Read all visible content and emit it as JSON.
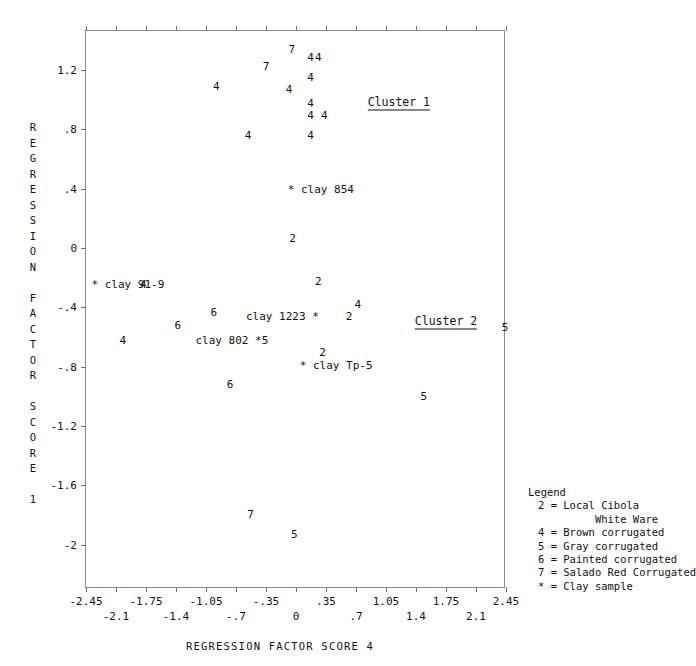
{
  "chart_data": {
    "type": "scatter",
    "title": "",
    "xlabel": "REGRESSION FACTOR SCORE 4",
    "ylabel": "REGRESSION FACTOR SCORE 1",
    "xlim": [
      -2.45,
      2.45
    ],
    "ylim": [
      -2.2,
      1.4
    ],
    "grid": false,
    "legend_position": "outside-right-bottom",
    "marker_encoding": "numeric glyph = ware type, asterisk = clay sample",
    "xticks_row1": [
      "-2.45",
      "-1.75",
      "-1.05",
      "-.35",
      ".35",
      "1.05",
      "1.75",
      "2.45"
    ],
    "xticks_row1_values": [
      -2.45,
      -1.75,
      -1.05,
      -0.35,
      0.35,
      1.05,
      1.75,
      2.45
    ],
    "xticks_row2": [
      "-2.1",
      "-1.4",
      "-.7",
      "0",
      ".7",
      "1.4",
      "2.1"
    ],
    "xticks_row2_values": [
      -2.1,
      -1.4,
      -0.7,
      0,
      0.7,
      1.4,
      2.1
    ],
    "yticks": [
      "1.2",
      ".8",
      ".4",
      "0",
      "-.4",
      "-.8",
      "-1.2",
      "-1.6",
      "-2"
    ],
    "ytick_values": [
      1.2,
      0.8,
      0.4,
      0,
      -0.4,
      -0.8,
      -1.2,
      -1.6,
      -2.0
    ],
    "points": [
      {
        "label": "7",
        "x": -0.05,
        "y": 1.34
      },
      {
        "label": "4",
        "x": 0.17,
        "y": 1.29
      },
      {
        "label": "4",
        "x": 0.26,
        "y": 1.29
      },
      {
        "label": "7",
        "x": -0.35,
        "y": 1.23
      },
      {
        "label": "4",
        "x": 0.17,
        "y": 1.15
      },
      {
        "label": "4",
        "x": -0.93,
        "y": 1.09
      },
      {
        "label": "4",
        "x": -0.08,
        "y": 1.07
      },
      {
        "label": "4",
        "x": 0.17,
        "y": 0.98
      },
      {
        "label": "4",
        "x": 0.17,
        "y": 0.9
      },
      {
        "label": "4",
        "x": 0.33,
        "y": 0.9
      },
      {
        "label": "4",
        "x": -0.56,
        "y": 0.76
      },
      {
        "label": "4",
        "x": 0.17,
        "y": 0.76
      },
      {
        "label": "2",
        "x": -0.04,
        "y": 0.07
      },
      {
        "label": "4",
        "x": -1.78,
        "y": -0.24
      },
      {
        "label": "2",
        "x": 0.26,
        "y": -0.22
      },
      {
        "label": "4",
        "x": 0.72,
        "y": -0.38
      },
      {
        "label": "2",
        "x": 0.62,
        "y": -0.46
      },
      {
        "label": "6",
        "x": -0.96,
        "y": -0.43
      },
      {
        "label": "6",
        "x": -1.38,
        "y": -0.52
      },
      {
        "label": "4",
        "x": -2.02,
        "y": -0.62
      },
      {
        "label": "5",
        "x": 2.44,
        "y": -0.53
      },
      {
        "label": "2",
        "x": 0.31,
        "y": -0.7
      },
      {
        "label": "6",
        "x": -0.77,
        "y": -0.92
      },
      {
        "label": "5",
        "x": 1.49,
        "y": -1.0
      },
      {
        "label": "7",
        "x": -0.53,
        "y": -1.79
      },
      {
        "label": "5",
        "x": -0.02,
        "y": -1.93
      }
    ],
    "clay_samples": [
      {
        "label": "clay 854",
        "x": -0.05,
        "y": 0.4,
        "text_side": "right"
      },
      {
        "label": "clay 91-9",
        "x": -2.34,
        "y": -0.24,
        "text_side": "right"
      },
      {
        "label": "clay 1223",
        "x": 0.22,
        "y": -0.46,
        "text_side": "left"
      },
      {
        "label": "clay 802",
        "x": -0.37,
        "y": -0.62,
        "text_side": "left"
      },
      {
        "label": "clay Tp-5",
        "x": 0.09,
        "y": -0.79,
        "text_side": "right"
      }
    ],
    "cluster_annotations": [
      {
        "label": "Cluster 1",
        "x": 1.2,
        "y": 0.98
      },
      {
        "label": "Cluster 2",
        "x": 1.75,
        "y": -0.5
      }
    ],
    "legend": {
      "title": "Legend",
      "entries": [
        {
          "symbol": "2",
          "description": "Local Cibola"
        },
        {
          "symbol": "",
          "description": "White Ware",
          "continuation": true
        },
        {
          "symbol": "4",
          "description": "Brown corrugated"
        },
        {
          "symbol": "5",
          "description": "Gray corrugated"
        },
        {
          "symbol": "6",
          "description": "Painted corrugated"
        },
        {
          "symbol": "7",
          "description": "Salado Red Corrugated"
        },
        {
          "symbol": "*",
          "description": "Clay sample"
        }
      ],
      "lines": [
        "Legend",
        "  2 = Local Cibola",
        "           White Ware",
        "  4 = Brown corrugated",
        "  5 = Gray corrugated",
        "  6 = Painted corrugated",
        "  7 = Salado Red Corrugated",
        "  * = Clay sample"
      ]
    },
    "ylabel_chars": [
      "R",
      "E",
      "G",
      "R",
      "E",
      "S",
      "S",
      "I",
      "O",
      "N",
      "",
      "F",
      "A",
      "C",
      "T",
      "O",
      "R",
      "",
      "S",
      "C",
      "O",
      "R",
      "E",
      "",
      "1"
    ]
  }
}
